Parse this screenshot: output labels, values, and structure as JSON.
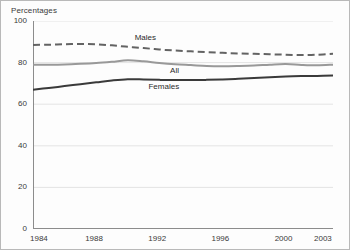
{
  "chart_data": {
    "type": "line",
    "title": "Percentages",
    "xlabel": "",
    "ylabel": "Percentages",
    "ylim": [
      0,
      100
    ],
    "xlim": [
      1984,
      2003
    ],
    "yticks": [
      0,
      20,
      40,
      60,
      80,
      100
    ],
    "xticks": [
      1984,
      1988,
      1992,
      1996,
      2000,
      2003
    ],
    "grid": true,
    "legend_position": "inline-annotations",
    "x": [
      1984,
      1985,
      1986,
      1987,
      1988,
      1989,
      1990,
      1991,
      1992,
      1993,
      1994,
      1995,
      1996,
      1997,
      1998,
      1999,
      2000,
      2001,
      2002,
      2003
    ],
    "series": [
      {
        "name": "Males",
        "style": "dashed",
        "color": "#636363",
        "values": [
          88.5,
          88.6,
          88.8,
          89.0,
          88.8,
          88.3,
          87.6,
          87.0,
          86.3,
          85.8,
          85.4,
          85.0,
          84.7,
          84.4,
          84.2,
          84.0,
          83.8,
          83.6,
          83.8,
          84.2
        ]
      },
      {
        "name": "All",
        "style": "solid",
        "color": "#999999",
        "values": [
          79.0,
          79.0,
          79.1,
          79.4,
          79.8,
          80.4,
          81.1,
          80.6,
          79.8,
          79.2,
          78.8,
          78.4,
          78.3,
          78.4,
          78.6,
          79.0,
          79.3,
          78.9,
          78.7,
          79.0
        ]
      },
      {
        "name": "Females",
        "style": "solid",
        "color": "#3a3a3a",
        "values": [
          67.0,
          67.8,
          68.7,
          69.6,
          70.5,
          71.4,
          72.0,
          71.9,
          71.7,
          71.6,
          71.6,
          71.7,
          71.9,
          72.2,
          72.6,
          73.0,
          73.3,
          73.5,
          73.6,
          73.8
        ]
      }
    ]
  },
  "axes": {
    "y_tick_labels": [
      "100",
      "80",
      "60",
      "40",
      "20",
      "0"
    ],
    "x_tick_labels": [
      "1984",
      "1988",
      "1992",
      "1996",
      "2000",
      "2003"
    ]
  }
}
